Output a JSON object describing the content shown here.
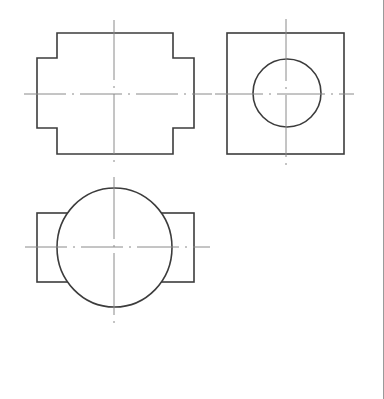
{
  "drawing": {
    "type": "orthographic-projection",
    "colors": {
      "background": "#ffffff",
      "outline": "#3c3c3c",
      "centerline": "#8a8a8a",
      "right_edge": "#9a9a9a"
    },
    "views": {
      "front": {
        "outline_points": "57,33 173,33 173,58 194,58 194,128 173,128 173,154 57,154 57,128 37,128 37,58 57,58",
        "center": [
          115,
          94
        ],
        "centerline_h": [
          24,
          94,
          212,
          94
        ],
        "centerline_v": [
          114,
          20,
          114,
          167
        ]
      },
      "side": {
        "rect": [
          227,
          33,
          117,
          121
        ],
        "circle": {
          "cx": 287,
          "cy": 93,
          "r": 34
        },
        "centerline_h": [
          215,
          94,
          354,
          94
        ],
        "centerline_v": [
          286,
          19,
          286,
          171
        ]
      },
      "top": {
        "rect": [
          37,
          213,
          157,
          69
        ],
        "circle": {
          "cx": 114.5,
          "cy": 247.5,
          "rx": 57.5,
          "ry": 59.5
        },
        "centerline_h": [
          25,
          247,
          210,
          247
        ],
        "centerline_v": [
          114,
          177,
          114,
          328
        ]
      }
    }
  }
}
